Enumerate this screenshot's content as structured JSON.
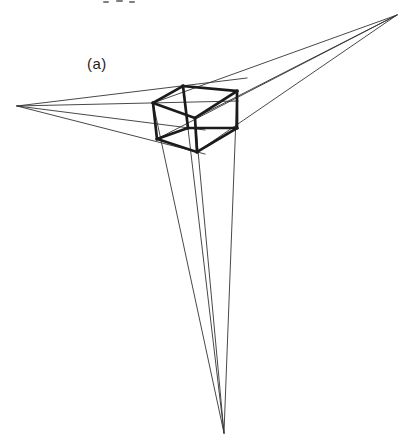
{
  "figure": {
    "label": "(a)",
    "background": "#ffffff",
    "cube_color": "#1b1b1b",
    "ray_color": "#333333",
    "cube_stroke_width": 2.7,
    "ray_stroke_width": 0.9,
    "canvas": {
      "width": 415,
      "height": 446
    },
    "vanishing_points": {
      "left": {
        "x": 17,
        "y": 106
      },
      "top_right": {
        "x": 397,
        "y": 15
      },
      "bottom": {
        "x": 224,
        "y": 433
      }
    },
    "cube_vertices": {
      "top_left": [
        153,
        103
      ],
      "top_back": [
        183,
        86
      ],
      "top_right": [
        237,
        91
      ],
      "top_front": [
        195,
        118
      ],
      "bottom_left": [
        157,
        139
      ],
      "bottom_back": [
        188,
        128
      ],
      "bottom_right": [
        237,
        128
      ],
      "bottom_front": [
        197,
        152
      ]
    },
    "cube_edges": [
      [
        "top_left",
        "top_back"
      ],
      [
        "top_back",
        "top_right"
      ],
      [
        "top_right",
        "top_front"
      ],
      [
        "top_front",
        "top_left"
      ],
      [
        "top_left",
        "bottom_left"
      ],
      [
        "top_back",
        "bottom_back"
      ],
      [
        "top_right",
        "bottom_right"
      ],
      [
        "top_front",
        "bottom_front"
      ],
      [
        "bottom_left",
        "bottom_back"
      ],
      [
        "bottom_back",
        "bottom_right"
      ],
      [
        "bottom_right",
        "bottom_front"
      ],
      [
        "bottom_front",
        "bottom_left"
      ]
    ],
    "rays": [
      {
        "from": "left",
        "to": [
          247,
          78
        ]
      },
      {
        "from": "left",
        "to": [
          238,
          101
        ]
      },
      {
        "from": "left",
        "to": [
          205,
          130
        ]
      },
      {
        "from": "left",
        "to": [
          205,
          154
        ]
      },
      {
        "from": "top_right",
        "to": [
          153,
          103
        ]
      },
      {
        "from": "top_right",
        "to": [
          195,
          118
        ]
      },
      {
        "from": "top_right",
        "to": [
          157,
          139
        ]
      },
      {
        "from": "top_right",
        "to": [
          197,
          152
        ]
      },
      {
        "from": "bottom",
        "to": [
          153,
          103
        ]
      },
      {
        "from": "bottom",
        "to": [
          183,
          86
        ]
      },
      {
        "from": "bottom",
        "to": [
          237,
          91
        ]
      },
      {
        "from": "bottom",
        "to": [
          195,
          118
        ]
      }
    ],
    "cropped_text_artifact": {
      "color": "#555555",
      "segments": [
        [
          104,
          2,
          108,
          2
        ],
        [
          117,
          1,
          122,
          1
        ],
        [
          130,
          2,
          134,
          2
        ]
      ]
    }
  }
}
